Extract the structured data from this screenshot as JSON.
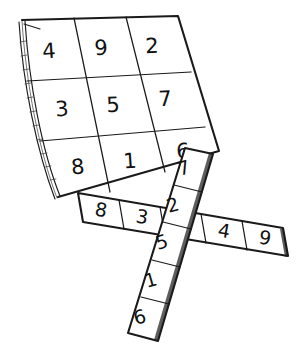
{
  "illustration": {
    "title": "Magic square sheet with crossed paper strips",
    "ink_color": "#1a1a1a",
    "paper_color": "#ffffff"
  },
  "grid_sheet": {
    "name": "magic-square-sheet",
    "rows": [
      [
        "4",
        "9",
        "2"
      ],
      [
        "3",
        "5",
        "7"
      ],
      [
        "8",
        "1",
        "6"
      ]
    ]
  },
  "vertical_strip": {
    "name": "vertical-strip",
    "cells": [
      "7",
      "2",
      "5",
      "1",
      "6"
    ]
  },
  "horizontal_strip": {
    "name": "horizontal-strip",
    "cells": [
      "8",
      "3",
      "5",
      "4",
      "9"
    ]
  }
}
